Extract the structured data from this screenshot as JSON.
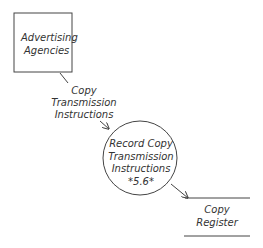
{
  "diagram": {
    "type": "data-flow-diagram",
    "colors": {
      "stroke": "#444444",
      "text": "#333333",
      "background": "#ffffff"
    },
    "external_entity": {
      "lines": [
        "Advertising",
        "Agencies"
      ]
    },
    "data_flow_1": {
      "lines": [
        "Copy",
        "Transmission",
        "Instructions"
      ]
    },
    "process": {
      "lines": [
        "Record Copy",
        "Transmission",
        "Instructions",
        "*5.6*"
      ]
    },
    "data_store": {
      "lines": [
        "Copy",
        "Register"
      ]
    }
  }
}
